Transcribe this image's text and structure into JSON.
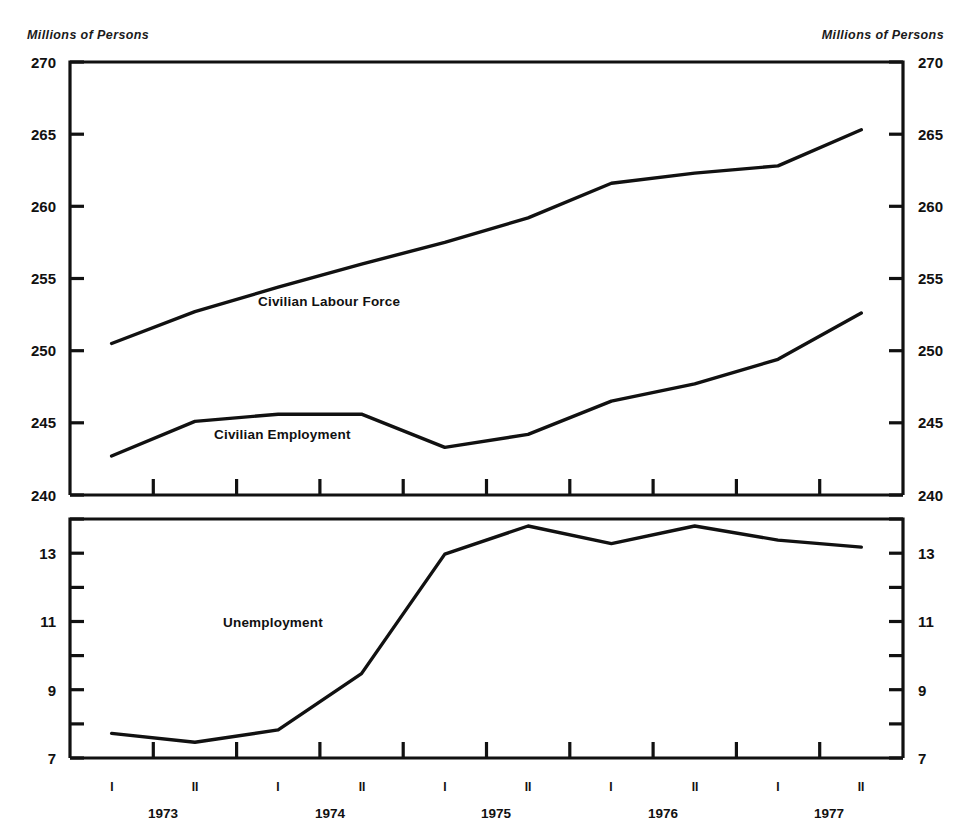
{
  "page": {
    "faint_top_text": "",
    "background": "#ffffff",
    "ink": "#111111"
  },
  "captions": {
    "left": "Millions of Persons",
    "right": "Millions of Persons"
  },
  "chart_data": [
    {
      "type": "line",
      "panel": "upper",
      "title": "",
      "xlabel": "",
      "ylabel": "Millions of Persons",
      "ylim": [
        240,
        270
      ],
      "yticks": [
        240,
        245,
        250,
        255,
        260,
        265,
        270
      ],
      "ytick_labels": [
        "240",
        "245",
        "250",
        "255",
        "260",
        "265",
        "270"
      ],
      "grid": false,
      "legend": "inline-annotations",
      "x": [
        "1973 I",
        "1973 II",
        "1974 I",
        "1974 II",
        "1975 I",
        "1975 II",
        "1976 I",
        "1976 II",
        "1977 I",
        "1977 II"
      ],
      "series": [
        {
          "name": "Civilian Labour Force",
          "values": [
            250.5,
            252.7,
            254.4,
            256.0,
            257.5,
            259.2,
            261.6,
            262.3,
            262.8,
            265.3
          ]
        },
        {
          "name": "Civilian Employment",
          "values": [
            242.7,
            245.1,
            245.6,
            245.6,
            243.3,
            244.2,
            246.5,
            247.7,
            249.4,
            252.6
          ]
        }
      ]
    },
    {
      "type": "line",
      "panel": "lower",
      "title": "",
      "xlabel": "",
      "ylabel": "Millions of Persons",
      "ylim": [
        7,
        13.8
      ],
      "yticks": [
        7,
        8,
        9,
        10,
        11,
        12,
        13
      ],
      "ytick_labels": [
        "7",
        "",
        "9",
        "",
        "11",
        "",
        "13"
      ],
      "ytick_labels_shown": [
        "7",
        "9",
        "11",
        "13"
      ],
      "grid": false,
      "legend": "inline-annotations",
      "x": [
        "1973 I",
        "1973 II",
        "1974 I",
        "1974 II",
        "1975 I",
        "1975 II",
        "1976 I",
        "1976 II",
        "1977 I",
        "1977 II"
      ],
      "series": [
        {
          "name": "Unemployment",
          "values": [
            7.7,
            7.45,
            7.8,
            9.4,
            12.8,
            13.6,
            13.1,
            13.6,
            13.2,
            13.0
          ]
        }
      ]
    }
  ],
  "x_axis": {
    "periods": [
      "I",
      "II",
      "I",
      "II",
      "I",
      "II",
      "I",
      "II",
      "I",
      "II"
    ],
    "years": [
      "1973",
      "1974",
      "1975",
      "1976",
      "1977"
    ]
  },
  "annotations": {
    "civilian_labour_force": "Civilian Labour Force",
    "civilian_employment": "Civilian Employment",
    "unemployment": "Unemployment"
  },
  "upper_panel": {
    "y_left": [
      "270",
      "265",
      "260",
      "255",
      "250",
      "245",
      "240"
    ],
    "y_right": [
      "270",
      "265",
      "260",
      "255",
      "250",
      "245",
      "240"
    ]
  },
  "lower_panel": {
    "y_left": [
      "13",
      "11",
      "9",
      "7"
    ],
    "y_right": [
      "13",
      "11",
      "9",
      "7"
    ]
  }
}
